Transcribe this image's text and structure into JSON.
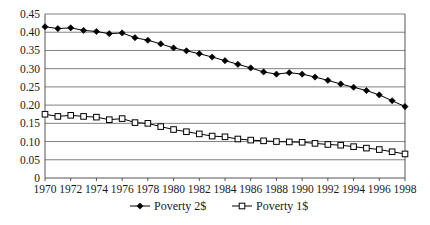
{
  "chart_data": {
    "type": "line",
    "title": "",
    "xlabel": "",
    "ylabel": "",
    "xlim": [
      1970,
      1998
    ],
    "ylim": [
      0,
      0.45
    ],
    "grid": true,
    "legend_position": "bottom",
    "x": [
      1970,
      1971,
      1972,
      1973,
      1974,
      1975,
      1976,
      1977,
      1978,
      1979,
      1980,
      1981,
      1982,
      1983,
      1984,
      1985,
      1986,
      1987,
      1988,
      1989,
      1990,
      1991,
      1992,
      1993,
      1994,
      1995,
      1996,
      1997,
      1998
    ],
    "ytick_labels": [
      "0",
      "0.05",
      "0.10",
      "0.15",
      "0.20",
      "0.25",
      "0.30",
      "0.35",
      "0.40",
      "0.45"
    ],
    "ytick_values": [
      0,
      0.05,
      0.1,
      0.15,
      0.2,
      0.25,
      0.3,
      0.35,
      0.4,
      0.45
    ],
    "xtick_labels": [
      "1970",
      "1972",
      "1974",
      "1976",
      "1978",
      "1980",
      "1982",
      "1984",
      "1986",
      "1988",
      "1990",
      "1992",
      "1994",
      "1996",
      "1998"
    ],
    "xtick_values": [
      1970,
      1972,
      1974,
      1976,
      1978,
      1980,
      1982,
      1984,
      1986,
      1988,
      1990,
      1992,
      1994,
      1996,
      1998
    ],
    "series": [
      {
        "name": "Poverty 2$",
        "marker": "filled-diamond",
        "color": "#000000",
        "values": [
          0.415,
          0.41,
          0.412,
          0.405,
          0.402,
          0.396,
          0.398,
          0.385,
          0.378,
          0.368,
          0.357,
          0.349,
          0.341,
          0.332,
          0.322,
          0.312,
          0.302,
          0.291,
          0.285,
          0.289,
          0.285,
          0.277,
          0.268,
          0.258,
          0.249,
          0.24,
          0.228,
          0.212,
          0.196
        ]
      },
      {
        "name": "Poverty 1$",
        "marker": "open-square",
        "color": "#000000",
        "values": [
          0.175,
          0.169,
          0.172,
          0.169,
          0.167,
          0.16,
          0.163,
          0.152,
          0.15,
          0.141,
          0.133,
          0.127,
          0.121,
          0.115,
          0.113,
          0.107,
          0.104,
          0.102,
          0.1,
          0.099,
          0.098,
          0.095,
          0.092,
          0.09,
          0.086,
          0.082,
          0.078,
          0.072,
          0.066
        ]
      }
    ]
  },
  "legend": {
    "entries": [
      {
        "label": "Poverty 2$",
        "marker": "filled-diamond"
      },
      {
        "label": "Poverty 1$",
        "marker": "open-square"
      }
    ]
  }
}
